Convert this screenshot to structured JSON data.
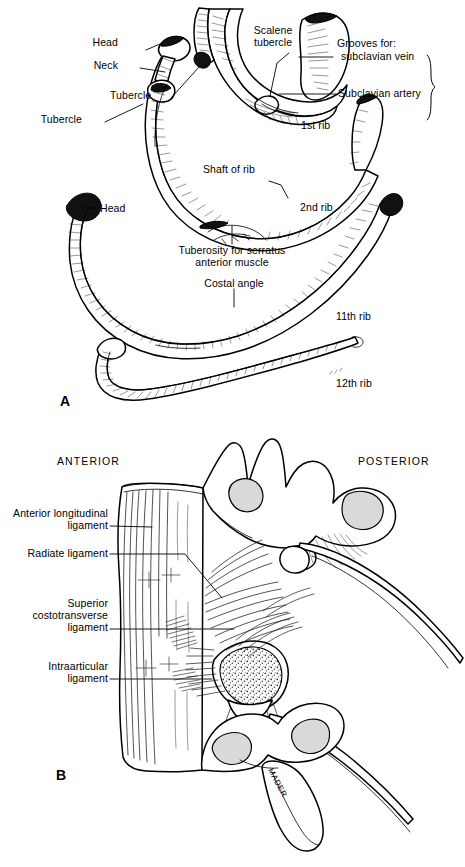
{
  "figure": {
    "panels": [
      {
        "letter": "A",
        "subject": "Typical and atypical ribs",
        "labels": [
          "Head",
          "Neck",
          "Tubercle",
          "Tubercle",
          "Scalene\ntubercle",
          "Grooves for:",
          "subclavian vein",
          "Subclavian artery",
          "1st rib",
          "Shaft of rib",
          "2nd rib",
          "Head",
          "Tuberosity for serratus",
          "anterior muscle",
          "Costal angle",
          "11th rib",
          "12th rib"
        ]
      },
      {
        "letter": "B",
        "subject": "Costovertebral joint ligaments",
        "labels": [
          "ANTERIOR",
          "POSTERIOR",
          "Anterior longitudinal\nligament",
          "Radiate ligament",
          "Superior\ncostotransverse\nligament",
          "Intraarticular\nligament"
        ]
      }
    ]
  },
  "panelA": {
    "letter": "A",
    "head_first": "Head",
    "neck": "Neck",
    "tubercle_left": "Tubercle",
    "tubercle_right": "Tubercle",
    "scalene_tubercle_line1": "Scalene",
    "scalene_tubercle_line2": "tubercle",
    "grooves_for": "Grooves for:",
    "subclavian_vein": "subclavian vein",
    "subclavian_artery": "Subclavian artery",
    "first_rib": "1st rib",
    "shaft_of_rib": "Shaft of rib",
    "second_rib": "2nd rib",
    "head_eleventh": "Head",
    "tuberosity_line1": "Tuberosity for serratus",
    "tuberosity_line2": "anterior muscle",
    "costal_angle": "Costal angle",
    "eleventh_rib": "11th rib",
    "twelfth_rib": "12th rib"
  },
  "panelB": {
    "letter": "B",
    "anterior": "ANTERIOR",
    "posterior": "POSTERIOR",
    "anterior_longitudinal_l1": "Anterior longitudinal",
    "anterior_longitudinal_l2": "ligament",
    "radiate_ligament": "Radiate ligament",
    "superior_costotransverse_l1": "Superior",
    "superior_costotransverse_l2": "costotransverse",
    "superior_costotransverse_l3": "ligament",
    "intraarticular_l1": "Intraarticular",
    "intraarticular_l2": "ligament",
    "artist_signature": "MADER"
  },
  "colors": {
    "background": "#ffffff",
    "ink": "#000000",
    "cartilage_grey": "#d9d9d9",
    "bone_shade": "#efefef"
  }
}
